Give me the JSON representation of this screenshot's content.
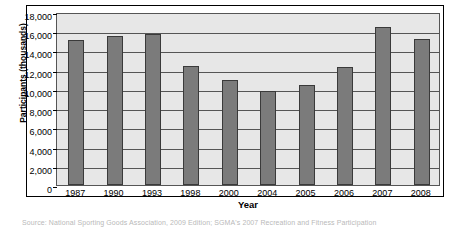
{
  "chart_data": {
    "type": "bar",
    "title": "",
    "xlabel": "Year",
    "ylabel": "Participants (thousands)",
    "categories": [
      "1987",
      "1990",
      "1993",
      "1998",
      "2000",
      "2004",
      "2005",
      "2006",
      "2007",
      "2008"
    ],
    "values": [
      15100,
      15500,
      15700,
      12400,
      10900,
      9800,
      10400,
      12300,
      16400,
      15200
    ],
    "ylim": [
      0,
      18000
    ],
    "ytick_step": 2000,
    "ytick_labels": [
      "18,000",
      "16,000",
      "14,000",
      "12,000",
      "10,000",
      "8,000",
      "6,000",
      "4,000",
      "2,000",
      "0"
    ],
    "ytick_values": [
      18000,
      16000,
      14000,
      12000,
      10000,
      8000,
      6000,
      4000,
      2000,
      0
    ],
    "grid": true,
    "legend": "none",
    "bar_color": "#7b7b7b",
    "bar_border_color": "#3a3a3a",
    "plot_background": "#e7e7e7",
    "frame_color": "#000000"
  },
  "caption": {
    "text": "Source: National Sporting Goods Association, 2009 Edition; SGMA's 2007 Recreation and Fitness Participation"
  }
}
